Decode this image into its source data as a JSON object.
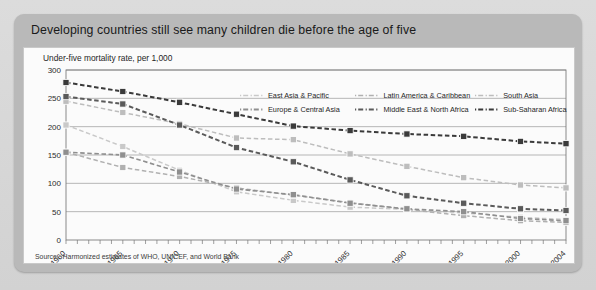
{
  "card": {
    "title": "Developing countries still see many children die before the age of five"
  },
  "panel": {
    "subtitle": "Under-five mortality rate, per 1,000",
    "source": "Source : Harmonized estimates of WHO, UNICEF, and World Bank"
  },
  "legend": {
    "items": [
      {
        "label": "East Asia & Pacific",
        "color": "#c9c9c9"
      },
      {
        "label": "Latin America & Caribbean",
        "color": "#b0b0b0"
      },
      {
        "label": "South Asia",
        "color": "#bdbdbd"
      },
      {
        "label": "Europe & Central Asia",
        "color": "#8f8f8f"
      },
      {
        "label": "Middle East & North Africa",
        "color": "#5a5a5a"
      },
      {
        "label": "Sub-Saharan Africa",
        "color": "#3a3a3a"
      }
    ]
  },
  "chart_data": {
    "type": "line",
    "title": "Developing countries still see many children die before the age of five",
    "subtitle": "Under-five mortality rate, per 1,000",
    "xlabel": "",
    "ylabel": "Under-five mortality rate, per 1,000",
    "ylim": [
      0,
      300
    ],
    "yticks": [
      0,
      50,
      100,
      150,
      200,
      250,
      300
    ],
    "xlim": [
      1960,
      2004
    ],
    "xticks": [
      1960,
      1965,
      1970,
      1975,
      1980,
      1985,
      1990,
      1995,
      2000,
      2004
    ],
    "x": [
      1960,
      1965,
      1970,
      1975,
      1980,
      1985,
      1990,
      1995,
      2000,
      2004
    ],
    "grid": "horizontal",
    "legend_position": "top-right",
    "marker": "square",
    "linestyle": "dashed",
    "series": [
      {
        "name": "East Asia & Pacific",
        "color": "#c9c9c9",
        "values": [
          203,
          165,
          123,
          85,
          70,
          58,
          54,
          48,
          40,
          36
        ]
      },
      {
        "name": "Latin America & Caribbean",
        "color": "#b0b0b0",
        "values": [
          155,
          128,
          112,
          92,
          79,
          66,
          54,
          43,
          34,
          31
        ]
      },
      {
        "name": "South Asia",
        "color": "#bdbdbd",
        "values": [
          245,
          225,
          205,
          180,
          177,
          152,
          130,
          110,
          97,
          92
        ]
      },
      {
        "name": "Europe & Central Asia",
        "color": "#8f8f8f",
        "values": [
          155,
          150,
          120,
          90,
          80,
          65,
          55,
          50,
          38,
          34
        ]
      },
      {
        "name": "Middle East & North Africa",
        "color": "#5a5a5a",
        "values": [
          253,
          240,
          203,
          163,
          138,
          106,
          78,
          65,
          55,
          52
        ]
      },
      {
        "name": "Sub-Saharan Africa",
        "color": "#3a3a3a",
        "values": [
          278,
          262,
          243,
          222,
          201,
          193,
          187,
          183,
          174,
          170
        ]
      }
    ]
  }
}
